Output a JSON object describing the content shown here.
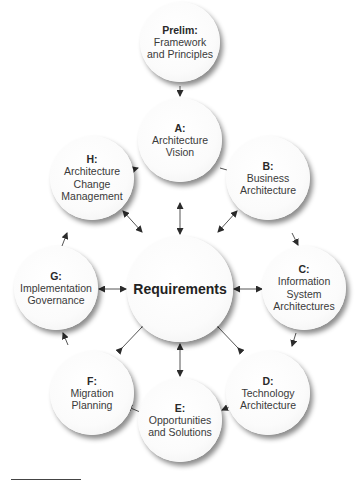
{
  "diagram": {
    "type": "TOGAF ADM cycle",
    "colors": {
      "node_fill": "#ffffff",
      "shadow": "#666666",
      "arrow": "#333333",
      "text": "#333333"
    },
    "center": {
      "label": "Requirements"
    },
    "nodes": [
      {
        "id": "prelim",
        "code": "Prelim:",
        "label": "Framework\nand Principles"
      },
      {
        "id": "a",
        "code": "A:",
        "label": "Architecture\nVision"
      },
      {
        "id": "b",
        "code": "B:",
        "label": "Business\nArchitecture"
      },
      {
        "id": "c",
        "code": "C:",
        "label": "Information\nSystem\nArchitectures"
      },
      {
        "id": "d",
        "code": "D:",
        "label": "Technology\nArchitecture"
      },
      {
        "id": "e",
        "code": "E:",
        "label": "Opportunities\nand Solutions"
      },
      {
        "id": "f",
        "code": "F:",
        "label": "Migration\nPlanning"
      },
      {
        "id": "g",
        "code": "G:",
        "label": "Implementation\nGovernance"
      },
      {
        "id": "h",
        "code": "H:",
        "label": "Architecture\nChange\nManagement"
      }
    ],
    "edges": [
      {
        "from": "Prelim",
        "to": "A",
        "direction": "one-way"
      },
      {
        "from": "A",
        "to": "B",
        "direction": "one-way"
      },
      {
        "from": "B",
        "to": "C",
        "direction": "one-way"
      },
      {
        "from": "C",
        "to": "D",
        "direction": "one-way"
      },
      {
        "from": "D",
        "to": "E",
        "direction": "one-way"
      },
      {
        "from": "E",
        "to": "F",
        "direction": "one-way"
      },
      {
        "from": "F",
        "to": "G",
        "direction": "one-way"
      },
      {
        "from": "G",
        "to": "H",
        "direction": "one-way"
      },
      {
        "from": "H",
        "to": "A",
        "direction": "one-way"
      },
      {
        "from": "Requirements",
        "to": "A",
        "direction": "two-way"
      },
      {
        "from": "Requirements",
        "to": "B",
        "direction": "two-way"
      },
      {
        "from": "Requirements",
        "to": "C",
        "direction": "two-way"
      },
      {
        "from": "Requirements",
        "to": "D",
        "direction": "two-way"
      },
      {
        "from": "Requirements",
        "to": "E",
        "direction": "two-way"
      },
      {
        "from": "Requirements",
        "to": "F",
        "direction": "two-way"
      },
      {
        "from": "Requirements",
        "to": "G",
        "direction": "two-way"
      },
      {
        "from": "Requirements",
        "to": "H",
        "direction": "two-way"
      }
    ]
  }
}
